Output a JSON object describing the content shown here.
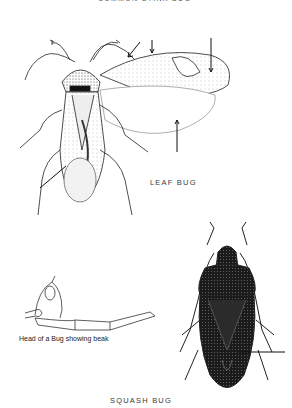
{
  "captions": {
    "top": "COMMON STINK BUG",
    "leaf_bug": "LEAF BUG",
    "head": "Head of a Bug showing beak",
    "squash_bug": "SQUASH BUG"
  },
  "figures": [
    {
      "name": "leaf-bug",
      "label": "LEAF BUG",
      "pointer_arrows": 5
    },
    {
      "name": "bug-head",
      "label": "Head of a Bug showing beak"
    },
    {
      "name": "squash-bug",
      "label": "SQUASH BUG",
      "pointer_arrows": 1
    }
  ],
  "colors": {
    "background": "#ffffff",
    "ink": "#1e1e1e",
    "caption": "#3a3a3a"
  }
}
